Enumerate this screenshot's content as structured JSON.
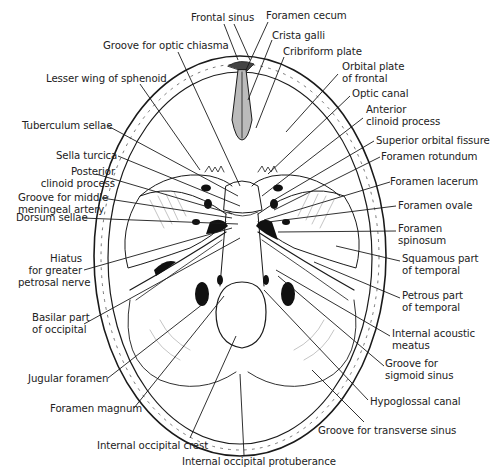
{
  "colors": {
    "ink": "#1a1a1a",
    "label": "#222222",
    "background": "#ffffff"
  },
  "labels": [
    {
      "id": "frontal-sinus",
      "text": "Frontal sinus",
      "x": 191,
      "y": 12,
      "align": "l",
      "lines": [
        [
          224,
          24,
          238,
          60
        ],
        [
          234,
          24,
          250,
          60
        ]
      ]
    },
    {
      "id": "foramen-cecum",
      "text": "Foramen cecum",
      "x": 266,
      "y": 10,
      "align": "l",
      "lines": [
        [
          268,
          22,
          246,
          70
        ]
      ]
    },
    {
      "id": "crista-galli",
      "text": "Crista galli",
      "x": 272,
      "y": 30,
      "align": "l",
      "lines": [
        [
          272,
          40,
          248,
          100
        ]
      ]
    },
    {
      "id": "cribriform-plate",
      "text": "Cribriform plate",
      "x": 283,
      "y": 46,
      "align": "l",
      "lines": [
        [
          284,
          57,
          256,
          128
        ]
      ]
    },
    {
      "id": "groove-optic-chiasma",
      "text": "Groove for optic chiasma",
      "x": 103,
      "y": 40,
      "align": "l",
      "lines": [
        [
          178,
          52,
          240,
          186
        ]
      ]
    },
    {
      "id": "lesser-wing-sphenoid",
      "text": "Lesser wing of sphenoid",
      "x": 46,
      "y": 73,
      "align": "l",
      "lines": [
        [
          140,
          84,
          200,
          170
        ]
      ]
    },
    {
      "id": "orbital-plate-frontal",
      "text": "Orbital plate\nof frontal",
      "x": 342,
      "y": 61,
      "align": "l",
      "lines": [
        [
          338,
          74,
          286,
          132
        ]
      ]
    },
    {
      "id": "optic-canal",
      "text": "Optic canal",
      "x": 352,
      "y": 88,
      "align": "l",
      "lines": [
        [
          350,
          96,
          268,
          174
        ]
      ]
    },
    {
      "id": "anterior-clinoid-process",
      "text": "Anterior\nclinoid process",
      "x": 366,
      "y": 104,
      "align": "l",
      "lines": [
        [
          363,
          118,
          262,
          196
        ]
      ]
    },
    {
      "id": "tuberculum-sellae",
      "text": "Tuberculum sellae",
      "x": 22,
      "y": 120,
      "align": "l",
      "lines": [
        [
          108,
          126,
          238,
          196
        ]
      ]
    },
    {
      "id": "superior-orbital-fissure",
      "text": "Superior orbital fissure",
      "x": 376,
      "y": 135,
      "align": "l",
      "lines": [
        [
          374,
          141,
          274,
          200
        ]
      ]
    },
    {
      "id": "foramen-rotundum",
      "text": "Foramen rotundum",
      "x": 381,
      "y": 151,
      "align": "l",
      "lines": [
        [
          380,
          157,
          274,
          210
        ]
      ]
    },
    {
      "id": "sella-turcica",
      "text": "Sella turcica",
      "x": 56,
      "y": 150,
      "align": "l",
      "lines": [
        [
          118,
          156,
          240,
          206
        ]
      ]
    },
    {
      "id": "posterior-clinoid-process",
      "text": "Posterior\nclinoid process",
      "x": 25,
      "y": 166,
      "align": "r",
      "w": 90,
      "lines": [
        [
          96,
          174,
          232,
          214
        ]
      ]
    },
    {
      "id": "foramen-lacerum",
      "text": "Foramen lacerum",
      "x": 390,
      "y": 176,
      "align": "l",
      "lines": [
        [
          390,
          182,
          264,
          220
        ]
      ]
    },
    {
      "id": "groove-middle-meningeal",
      "text": "Groove for middle\nmeningeal artery",
      "x": 18,
      "y": 192,
      "align": "r",
      "w": 84,
      "lines": [
        [
          102,
          198,
          232,
          218
        ]
      ]
    },
    {
      "id": "foramen-ovale",
      "text": "Foramen ovale",
      "x": 398,
      "y": 200,
      "align": "l",
      "lines": [
        [
          396,
          206,
          268,
          222
        ]
      ]
    },
    {
      "id": "dorsum-sellae",
      "text": "Dorsum sellae",
      "x": 16,
      "y": 212,
      "align": "l",
      "lines": [
        [
          82,
          218,
          238,
          224
        ]
      ]
    },
    {
      "id": "foramen-spinosum",
      "text": "Foramen\nspinosum",
      "x": 398,
      "y": 223,
      "align": "l",
      "lines": [
        [
          396,
          231,
          278,
          232
        ]
      ]
    },
    {
      "id": "squamous-temporal",
      "text": "Squamous part\nof temporal",
      "x": 402,
      "y": 253,
      "align": "l",
      "lines": [
        [
          400,
          261,
          336,
          246
        ]
      ]
    },
    {
      "id": "hiatus-greater-petrosal",
      "text": "Hiatus\nfor greater\npetrosal nerve",
      "x": 18,
      "y": 253,
      "align": "r",
      "w": 64,
      "lines": [
        [
          84,
          270,
          232,
          228
        ]
      ]
    },
    {
      "id": "petrous-temporal",
      "text": "Petrous part\nof temporal",
      "x": 402,
      "y": 290,
      "align": "l",
      "lines": [
        [
          400,
          298,
          314,
          262
        ]
      ]
    },
    {
      "id": "basilar-occipital",
      "text": "Basilar part\nof occipital",
      "x": 32,
      "y": 312,
      "align": "r",
      "w": 52,
      "lines": [
        [
          84,
          324,
          240,
          238
        ]
      ]
    },
    {
      "id": "internal-acoustic-meatus",
      "text": "Internal acoustic\nmeatus",
      "x": 392,
      "y": 328,
      "align": "l",
      "lines": [
        [
          390,
          336,
          276,
          270
        ]
      ]
    },
    {
      "id": "groove-sigmoid-sinus",
      "text": "Groove for\nsigmoid sinus",
      "x": 385,
      "y": 358,
      "align": "l",
      "lines": [
        [
          384,
          366,
          278,
          276
        ]
      ]
    },
    {
      "id": "jugular-foramen",
      "text": "Jugular foramen",
      "x": 28,
      "y": 373,
      "align": "l",
      "lines": [
        [
          108,
          378,
          208,
          300
        ]
      ]
    },
    {
      "id": "hypoglossal-canal",
      "text": "Hypoglossal canal",
      "x": 370,
      "y": 396,
      "align": "l",
      "lines": [
        [
          368,
          400,
          264,
          290
        ]
      ]
    },
    {
      "id": "foramen-magnum",
      "text": "Foramen magnum",
      "x": 50,
      "y": 403,
      "align": "l",
      "lines": [
        [
          134,
          408,
          224,
          296
        ]
      ]
    },
    {
      "id": "groove-transverse-sinus",
      "text": "Groove for transverse sinus",
      "x": 318,
      "y": 425,
      "align": "l",
      "lines": [
        [
          364,
          422,
          312,
          370
        ]
      ]
    },
    {
      "id": "internal-occipital-crest",
      "text": "Internal occipital crest",
      "x": 97,
      "y": 440,
      "align": "l",
      "lines": [
        [
          190,
          438,
          236,
          336
        ]
      ]
    },
    {
      "id": "internal-occipital-protuberance",
      "text": "Internal occipital protuberance",
      "x": 182,
      "y": 456,
      "align": "l",
      "lines": [
        [
          244,
          455,
          240,
          374
        ]
      ]
    }
  ]
}
